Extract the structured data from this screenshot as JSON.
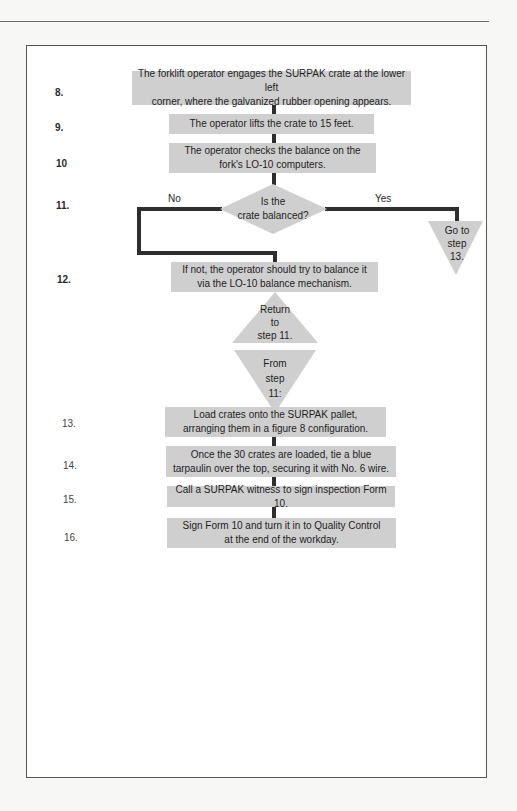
{
  "diagram": {
    "type": "flowchart",
    "colors": {
      "box_fill": "#cfcfcf",
      "connector": "#2e2e2e",
      "frame": "#555555",
      "background": "#ffffff"
    },
    "step_numbers": [
      "8.",
      "9.",
      "10",
      "11.",
      "12.",
      "13.",
      "14.",
      "15.",
      "16."
    ],
    "steps": {
      "s8": "The forklift operator engages the SURPAK crate at the lower left\ncorner, where the galvanized rubber opening appears.",
      "s9": "The operator lifts the crate to 15 feet.",
      "s10": "The operator checks the balance on the\nfork's LO-10 computers.",
      "s11": "Is the\ncrate balanced?",
      "s12": "If not, the operator should try to balance it\nvia the LO-10 balance mechanism.",
      "s13": "Load crates onto the SURPAK pallet,\narranging them in a figure 8 configuration.",
      "s14": "Once the 30 crates are loaded, tie a blue\ntarpaulin over the top, securing it with No. 6 wire.",
      "s15": "Call a SURPAK witness to sign inspection Form 10.",
      "s16": "Sign Form 10 and turn it in to Quality Control\nat the end of the workday."
    },
    "decision": {
      "no_label": "No",
      "yes_label": "Yes"
    },
    "connectors": {
      "goto": "Go to\nstep\n13.",
      "return": "Return\nto\nstep 11.",
      "from": "From\nstep\n11:"
    }
  }
}
